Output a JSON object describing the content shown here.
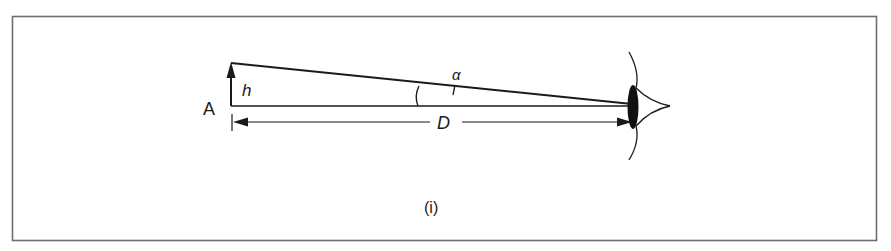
{
  "diagram": {
    "caption": "(i)",
    "labels": {
      "point": "A",
      "height": "h",
      "angle": "α",
      "distance": "D"
    },
    "elements": [
      {
        "name": "object-arrow",
        "description": "vertical arrow of height h at point A"
      },
      {
        "name": "sight-line",
        "description": "line from top of object to eye"
      },
      {
        "name": "baseline",
        "description": "horizontal line from A to eye"
      },
      {
        "name": "angle-arc",
        "description": "arc marking visual angle α"
      },
      {
        "name": "distance-dimension",
        "description": "double-headed dimension line D"
      },
      {
        "name": "eye",
        "description": "eye with lens at right"
      }
    ],
    "colors": {
      "stroke": "#1a1a1a",
      "frame": "#6e6e6e",
      "background": "#ffffff"
    }
  }
}
